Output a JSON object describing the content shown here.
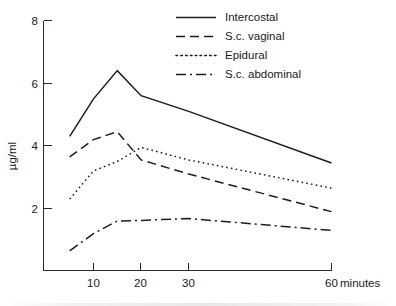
{
  "chart_data": {
    "type": "line",
    "title": "",
    "subtitle": "",
    "xlabel": "minutes",
    "ylabel": "µg/ml",
    "xlim": [
      5,
      60
    ],
    "ylim": [
      0,
      8
    ],
    "grid": false,
    "legend_position": "top-right",
    "x_ticks": [
      10,
      20,
      30,
      60
    ],
    "x_tick_labels": [
      "10",
      "20",
      "30",
      "60"
    ],
    "x_unit_label": "minutes",
    "y_ticks": [
      2,
      4,
      6,
      8
    ],
    "y_tick_labels": [
      "2",
      "4",
      "6",
      "8"
    ],
    "series": [
      {
        "name": "Intercostal",
        "line_style": "solid",
        "x": [
          5,
          10,
          15,
          20,
          30,
          60
        ],
        "values": [
          4.3,
          5.5,
          6.4,
          5.6,
          5.1,
          3.45
        ]
      },
      {
        "name": "S.c. vaginal",
        "line_style": "dashed",
        "x": [
          5,
          10,
          15,
          20,
          30,
          60
        ],
        "values": [
          3.65,
          4.2,
          4.45,
          3.55,
          3.1,
          1.9
        ]
      },
      {
        "name": "Epidural",
        "line_style": "dotted",
        "x": [
          5,
          10,
          15,
          20,
          30,
          60
        ],
        "values": [
          2.3,
          3.2,
          3.5,
          3.95,
          3.55,
          2.65
        ]
      },
      {
        "name": "S.c. abdominal",
        "line_style": "dash-dot",
        "x": [
          5,
          10,
          15,
          20,
          30,
          60
        ],
        "values": [
          0.65,
          1.2,
          1.6,
          1.62,
          1.68,
          1.3
        ]
      }
    ]
  },
  "legend": {
    "items": [
      {
        "label": "Intercostal",
        "style": "solid"
      },
      {
        "label": "S.c. vaginal",
        "style": "dashed"
      },
      {
        "label": "Epidural",
        "style": "dotted"
      },
      {
        "label": "S.c. abdominal",
        "style": "dash-dot"
      }
    ]
  },
  "colors": {
    "ink": "#1d1d1d",
    "axis": "#2b2b2b",
    "background": "#ffffff"
  }
}
